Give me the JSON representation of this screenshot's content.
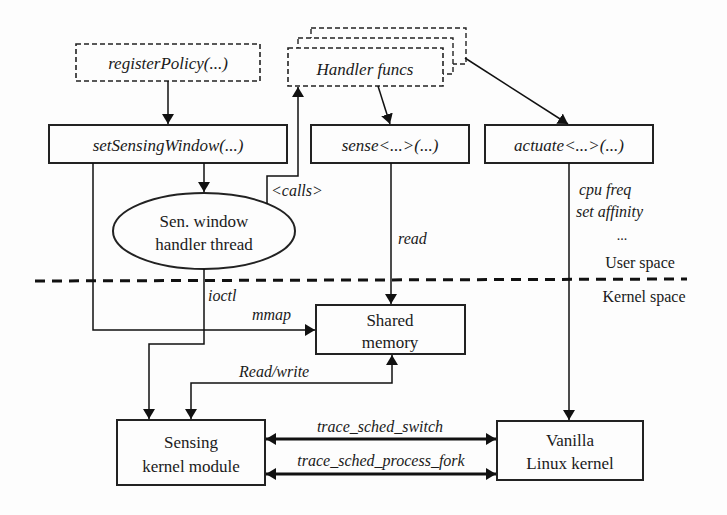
{
  "diagram": {
    "nodes": {
      "register_policy": {
        "label": "registerPolicy(...)",
        "style": "dashed"
      },
      "handler_funcs": {
        "label": "Handler funcs",
        "style": "dashed-stacked"
      },
      "set_sensing_window": {
        "label": "setSensingWindow(...)"
      },
      "sense": {
        "label": "sense<...>(...)"
      },
      "actuate": {
        "label": "actuate<...>(...)"
      },
      "handler_thread": {
        "line1": "Sen. window",
        "line2": "handler thread",
        "shape": "ellipse"
      },
      "shared_memory": {
        "line1": "Shared",
        "line2": "memory"
      },
      "sensing_module": {
        "line1": "Sensing",
        "line2": "kernel module"
      },
      "vanilla_kernel": {
        "line1": "Vanilla",
        "line2": "Linux kernel"
      }
    },
    "edge_labels": {
      "calls": "<calls>",
      "read": "read",
      "ioctl": "ioctl",
      "mmap": "mmap",
      "read_write": "Read/write",
      "trace_switch": "trace_sched_switch",
      "trace_fork": "trace_sched_process_fork",
      "actuate_1": "cpu freq",
      "actuate_2": "set affinity",
      "actuate_3": "..."
    },
    "regions": {
      "user_space": "User space",
      "kernel_space": "Kernel space"
    }
  }
}
